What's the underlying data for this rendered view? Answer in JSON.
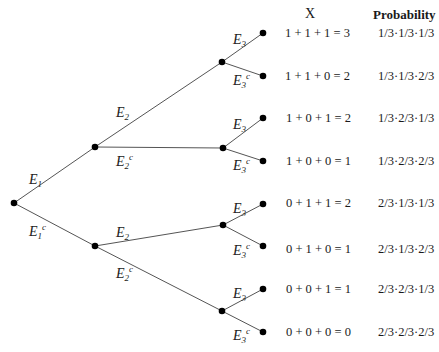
{
  "headers": {
    "x": "X",
    "probability": "Probability"
  },
  "edge_labels": {
    "e1": {
      "base": "E",
      "sub": "1",
      "sup": ""
    },
    "e1c": {
      "base": "E",
      "sub": "1",
      "sup": "c"
    },
    "e2": {
      "base": "E",
      "sub": "2",
      "sup": ""
    },
    "e2c": {
      "base": "E",
      "sub": "2",
      "sup": "c"
    },
    "e3": {
      "base": "E",
      "sub": "3",
      "sup": ""
    },
    "e3c": {
      "base": "E",
      "sub": "3",
      "sup": "c"
    }
  },
  "rows": [
    {
      "x": "1 + 1 + 1 = 3",
      "p": "1/3·1/3·1/3"
    },
    {
      "x": "1 + 1 + 0 = 2",
      "p": "1/3·1/3·2/3"
    },
    {
      "x": "1 + 0 + 1 = 2",
      "p": "1/3·2/3·1/3"
    },
    {
      "x": "1 + 0 + 0 = 1",
      "p": "1/3·2/3·2/3"
    },
    {
      "x": "0 + 1 + 1 = 2",
      "p": "2/3·1/3·1/3"
    },
    {
      "x": "0 + 1 + 0 = 1",
      "p": "2/3·1/3·2/3"
    },
    {
      "x": "0 + 0 + 1 = 1",
      "p": "2/3·2/3·1/3"
    },
    {
      "x": "0 + 0 + 0 = 0",
      "p": "2/3·2/3·2/3"
    }
  ]
}
